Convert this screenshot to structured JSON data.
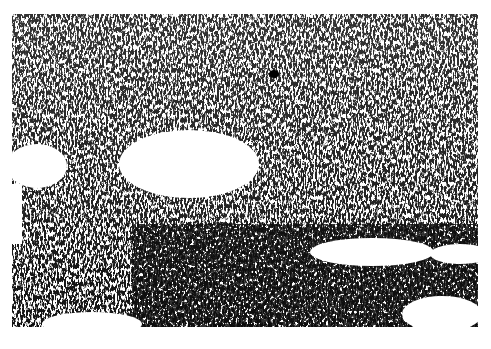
{
  "image": {
    "kind": "grayscale micrograph",
    "frame": {
      "x": 12,
      "y": 14,
      "width": 466,
      "height": 313
    },
    "colors": {
      "background": "#ffffff",
      "ink": "#111111",
      "midtone": "#555555"
    },
    "voids": [
      {
        "cx": 177,
        "cy": 150,
        "rx": 70,
        "ry": 34
      },
      {
        "cx": 25,
        "cy": 152,
        "rx": 30,
        "ry": 22
      },
      {
        "cx": 360,
        "cy": 238,
        "rx": 62,
        "ry": 14
      },
      {
        "cx": 448,
        "cy": 240,
        "rx": 30,
        "ry": 10
      },
      {
        "cx": 80,
        "cy": 310,
        "rx": 50,
        "ry": 12
      },
      {
        "cx": 430,
        "cy": 300,
        "rx": 40,
        "ry": 18
      }
    ]
  }
}
